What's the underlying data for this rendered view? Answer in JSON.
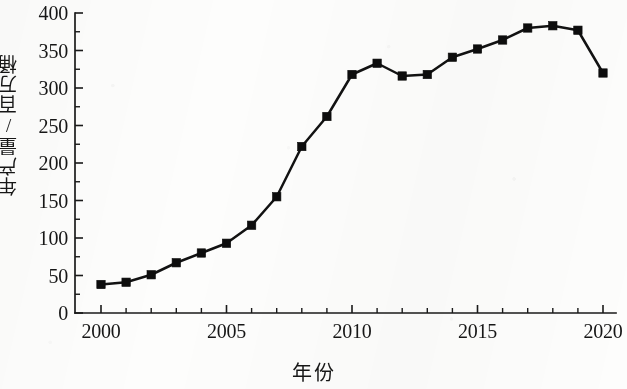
{
  "chart_data": {
    "type": "line",
    "title": "",
    "xlabel": "年份",
    "ylabel": "年产量/百万桶",
    "xlim": [
      2000,
      2020
    ],
    "ylim": [
      0,
      400
    ],
    "grid": false,
    "legend": null,
    "marker": "square",
    "line_color": "#121212",
    "marker_color": "#0d0d0d",
    "x_ticks": [
      2000,
      2005,
      2010,
      2015,
      2020
    ],
    "x_tick_labels": [
      "2000",
      "2005",
      "2010",
      "2015",
      "2020"
    ],
    "x_minor_tick_interval": 1,
    "y_ticks": [
      0,
      50,
      100,
      150,
      200,
      250,
      300,
      350,
      400
    ],
    "y_tick_labels": [
      "0",
      "50",
      "100",
      "150",
      "200",
      "250",
      "300",
      "350",
      "400"
    ],
    "y_minor_tick_interval": 25,
    "series": [
      {
        "name": "年产量",
        "x": [
          2000,
          2001,
          2002,
          2003,
          2004,
          2005,
          2006,
          2007,
          2008,
          2009,
          2010,
          2011,
          2012,
          2013,
          2014,
          2015,
          2016,
          2017,
          2018,
          2019,
          2020
        ],
        "values": [
          38,
          41,
          51,
          67,
          80,
          93,
          117,
          155,
          222,
          262,
          318,
          333,
          316,
          318,
          341,
          352,
          364,
          380,
          383,
          377,
          320
        ]
      }
    ]
  }
}
